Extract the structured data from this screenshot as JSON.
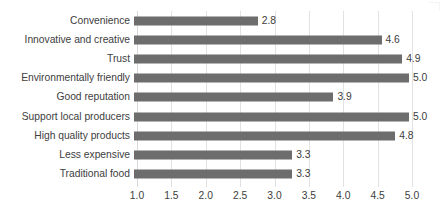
{
  "chart_data": {
    "type": "bar",
    "orientation": "horizontal",
    "title": "",
    "subtitle": "",
    "xlabel": "",
    "ylabel": "",
    "xlim": [
      1.0,
      5.0
    ],
    "xticks": [
      "1.0",
      "1.5",
      "2.0",
      "2.5",
      "3.0",
      "3.5",
      "4.0",
      "4.5",
      "5.0"
    ],
    "xtick_values": [
      1.0,
      1.5,
      2.0,
      2.5,
      3.0,
      3.5,
      4.0,
      4.5,
      5.0
    ],
    "grid": "vertical",
    "legend": "none",
    "bar_color": "#6d6d6d",
    "categories": [
      "Convenience",
      "Innovative and creative",
      "Trust",
      "Environmentally friendly",
      "Good reputation",
      "Support local producers",
      "High quality products",
      "Less expensive",
      "Traditional food"
    ],
    "values": [
      2.8,
      4.6,
      4.9,
      5.0,
      3.9,
      5.0,
      4.8,
      3.3,
      3.3
    ],
    "data_labels": [
      "2.8",
      "4.6",
      "4.9",
      "5.0",
      "3.9",
      "5.0",
      "4.8",
      "3.3",
      "3.3"
    ]
  }
}
